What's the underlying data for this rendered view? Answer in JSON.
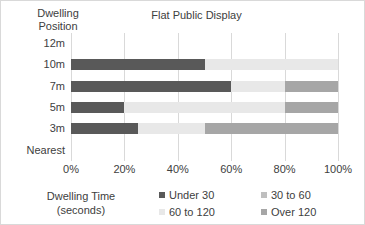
{
  "chart_data": {
    "type": "bar",
    "subtype": "stacked-horizontal-100-percent",
    "title": "Flat Public Display",
    "xlabel": "Dwelling Time (seconds)",
    "ylabel": "Dwelling Position",
    "xlabel_line1": "Dwelling Time",
    "xlabel_line2": "(seconds)",
    "ylabel_line1": "Dwelling",
    "ylabel_line2": "Position",
    "orientation": "horizontal",
    "grid": true,
    "legend_position": "bottom",
    "xlim": [
      0,
      100
    ],
    "xticks": [
      0,
      20,
      40,
      60,
      80,
      100
    ],
    "xtick_labels": [
      "0%",
      "20%",
      "40%",
      "60%",
      "80%",
      "100%"
    ],
    "categories": [
      "12m",
      "10m",
      "7m",
      "5m",
      "3m",
      "Nearest"
    ],
    "series": [
      {
        "name": "Under 30",
        "color": "#595959",
        "values": [
          0,
          50,
          60,
          20,
          25,
          0
        ]
      },
      {
        "name": "30 to 60",
        "color": "#bfbfbf",
        "values": [
          0,
          0,
          0,
          0,
          0,
          0
        ]
      },
      {
        "name": "60 to 120",
        "color": "#e8e8e8",
        "values": [
          0,
          50,
          20,
          60,
          25,
          0
        ]
      },
      {
        "name": "Over 120",
        "color": "#a6a6a6",
        "values": [
          0,
          0,
          20,
          20,
          50,
          0
        ]
      }
    ]
  }
}
